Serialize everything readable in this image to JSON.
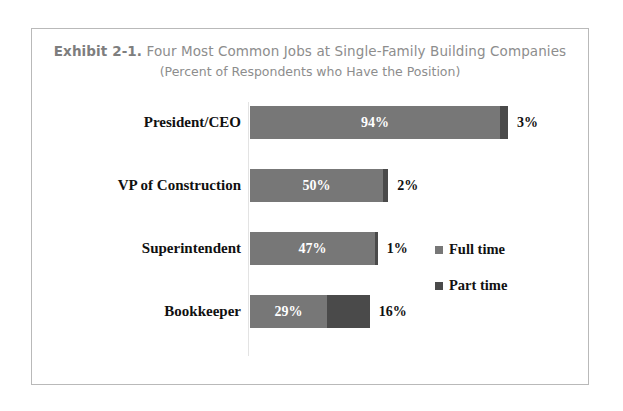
{
  "frame": {
    "border_color": "#b9b9b9",
    "background": "#ffffff"
  },
  "title": {
    "exhibit_number": "Exhibit 2-1.",
    "main": "Four Most Common Jobs at Single-Family Building Companies",
    "subtitle": "(Percent of Respondents who Have the Position)"
  },
  "legend": {
    "items": [
      {
        "label": "Full time",
        "color": "#777777",
        "swatch_name": "legend-swatch-full-time"
      },
      {
        "label": "Part time",
        "color": "#4a4a4a",
        "swatch_name": "legend-swatch-part-time"
      }
    ]
  },
  "chart_data": {
    "type": "bar",
    "orientation": "horizontal",
    "stacked": true,
    "title": "Exhibit 2-1. Four Most Common Jobs at Single-Family Building Companies",
    "subtitle": "(Percent of Respondents who Have the Position)",
    "xlabel": "",
    "ylabel": "",
    "xlim": [
      0,
      100
    ],
    "grid": false,
    "legend_position": "right-middle",
    "categories": [
      "President/CEO",
      "VP of Construction",
      "Superintendent",
      "Bookkeeper"
    ],
    "series": [
      {
        "name": "Full time",
        "color": "#777777",
        "values": [
          94,
          50,
          47,
          29
        ]
      },
      {
        "name": "Part time",
        "color": "#4a4a4a",
        "values": [
          3,
          2,
          1,
          16
        ]
      }
    ],
    "data_labels": {
      "full_time": [
        "94%",
        "50%",
        "47%",
        "29%"
      ],
      "part_time": [
        "3%",
        "2%",
        "1%",
        "16%"
      ]
    }
  },
  "rows": [
    {
      "label": "President/CEO",
      "full_value": "94%",
      "full_pct": 94,
      "part_value": "3%",
      "part_pct": 3,
      "show_full_label": true
    },
    {
      "label": "VP of Construction",
      "full_value": "50%",
      "full_pct": 50,
      "part_value": "2%",
      "part_pct": 2,
      "show_full_label": true
    },
    {
      "label": "Superintendent",
      "full_value": "47%",
      "full_pct": 47,
      "part_value": "1%",
      "part_pct": 1,
      "show_full_label": true
    },
    {
      "label": "Bookkeeper",
      "full_value": "29%",
      "full_pct": 29,
      "part_value": "16%",
      "part_pct": 16,
      "show_full_label": true
    }
  ],
  "layout": {
    "px_per_pct": 2.66,
    "row_tops": [
      77,
      140,
      203,
      266
    ],
    "bar_height": 33
  }
}
